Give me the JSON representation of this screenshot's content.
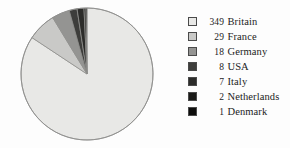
{
  "chart_data": {
    "type": "pie",
    "title": "",
    "categories": [
      "Britain",
      "France",
      "Germany",
      "USA",
      "Italy",
      "Netherlands",
      "Denmark"
    ],
    "values": [
      349,
      29,
      18,
      8,
      7,
      2,
      1
    ],
    "total": 414,
    "start_angle_deg": 0,
    "direction": "clockwise",
    "legend_position": "right",
    "grid": false,
    "slice_colors": [
      "#e8e8e6",
      "#c9c9c7",
      "#949492",
      "#3d3d3b",
      "#2c2c2a",
      "#1a1a18",
      "#0d0d0c"
    ],
    "slices": [
      {
        "label": "Britain",
        "value": 349,
        "color": "#e8e8e6"
      },
      {
        "label": "France",
        "value": 29,
        "color": "#c9c9c7"
      },
      {
        "label": "Germany",
        "value": 18,
        "color": "#949492"
      },
      {
        "label": "USA",
        "value": 8,
        "color": "#3d3d3b"
      },
      {
        "label": "Italy",
        "value": 7,
        "color": "#2c2c2a"
      },
      {
        "label": "Netherlands",
        "value": 2,
        "color": "#1a1a18"
      },
      {
        "label": "Denmark",
        "value": 1,
        "color": "#0d0d0c"
      }
    ]
  },
  "pie": {
    "center_x": 69,
    "center_y": 70,
    "radius": 66,
    "outline_color": "#8f8f8d"
  },
  "legend": {
    "rows": [
      {
        "value": "349",
        "name": "Britain",
        "color": "#e8e8e6"
      },
      {
        "value": "29",
        "name": "France",
        "color": "#c9c9c7"
      },
      {
        "value": "18",
        "name": "Germany",
        "color": "#949492"
      },
      {
        "value": "8",
        "name": "USA",
        "color": "#3d3d3b"
      },
      {
        "value": "7",
        "name": "Italy",
        "color": "#2c2c2a"
      },
      {
        "value": "2",
        "name": "Netherlands",
        "color": "#1a1a18"
      },
      {
        "value": "1",
        "name": "Denmark",
        "color": "#0d0d0c"
      }
    ]
  }
}
